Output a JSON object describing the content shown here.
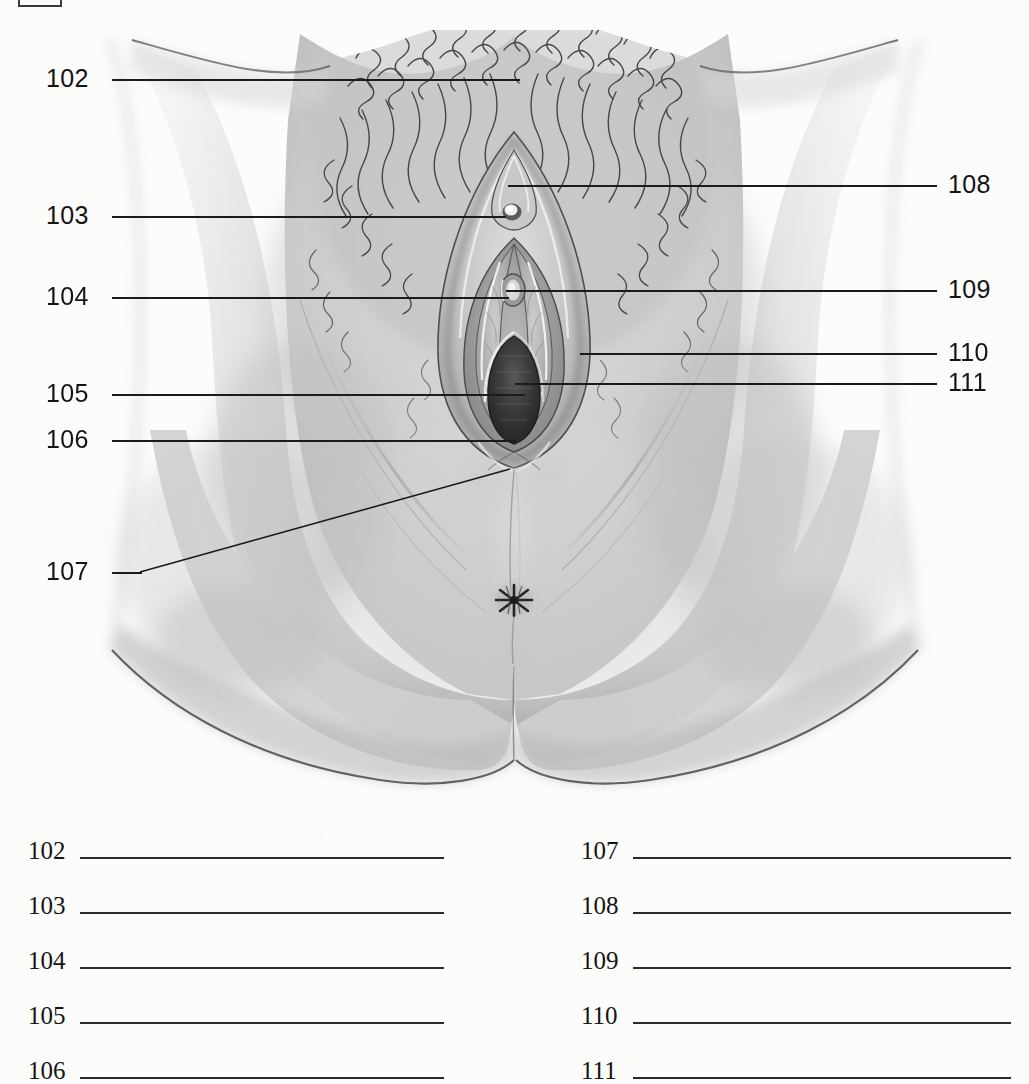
{
  "document": {
    "type": "anatomy-labeling-worksheet",
    "title": "",
    "background_color": "#fcfcfb",
    "ink_color": "#1b1b1b"
  },
  "illustration": {
    "name": "external-female-genitalia-diagram",
    "style": "grayscale pencil/airbrush medical illustration",
    "description": "Anterior view of the external female genitalia (vulva) with surrounding thighs, pubic hair, and perineum"
  },
  "leaders": [
    {
      "id": "102",
      "number": "102",
      "side": "left",
      "label_x": 46,
      "label_y": 66,
      "line_x": 112,
      "line_y": 79,
      "line_w": 408,
      "slanted": false
    },
    {
      "id": "103",
      "number": "103",
      "side": "left",
      "label_x": 46,
      "label_y": 203,
      "line_x": 112,
      "line_y": 216,
      "line_w": 394,
      "slanted": false
    },
    {
      "id": "104",
      "number": "104",
      "side": "left",
      "label_x": 46,
      "label_y": 284,
      "line_x": 112,
      "line_y": 297,
      "line_w": 397,
      "slanted": false
    },
    {
      "id": "105",
      "number": "105",
      "side": "left",
      "label_x": 46,
      "label_y": 381,
      "line_x": 112,
      "line_y": 394,
      "line_w": 413,
      "slanted": false
    },
    {
      "id": "106",
      "number": "106",
      "side": "left",
      "label_x": 46,
      "label_y": 427,
      "line_x": 112,
      "line_y": 440,
      "line_w": 404,
      "slanted": false
    },
    {
      "id": "107",
      "number": "107",
      "side": "left",
      "label_x": 46,
      "label_y": 559,
      "line_x": 112,
      "line_y": 572,
      "line_w": 28,
      "slanted": true,
      "slant": {
        "x1": 140,
        "y1": 572,
        "x2": 508,
        "y2": 469
      }
    },
    {
      "id": "108",
      "number": "108",
      "side": "right",
      "label_x": 950,
      "label_y": 172,
      "line_x": 508,
      "line_y": 185,
      "line_w": 429,
      "slanted": false
    },
    {
      "id": "109",
      "number": "109",
      "side": "right",
      "label_x": 950,
      "label_y": 277,
      "line_x": 506,
      "line_y": 290,
      "line_w": 431,
      "slanted": false
    },
    {
      "id": "110",
      "number": "110",
      "side": "right",
      "label_x": 950,
      "label_y": 340,
      "line_x": 580,
      "line_y": 353,
      "line_w": 357,
      "slanted": false
    },
    {
      "id": "111",
      "number": "111",
      "side": "right",
      "label_x": 950,
      "label_y": 370,
      "line_x": 515,
      "line_y": 383,
      "line_w": 422,
      "slanted": false
    }
  ],
  "answer_blanks": {
    "left_column": [
      {
        "number": "102",
        "value": ""
      },
      {
        "number": "103",
        "value": ""
      },
      {
        "number": "104",
        "value": ""
      },
      {
        "number": "105",
        "value": ""
      },
      {
        "number": "106",
        "value": ""
      }
    ],
    "right_column": [
      {
        "number": "107",
        "value": ""
      },
      {
        "number": "108",
        "value": ""
      },
      {
        "number": "109",
        "value": ""
      },
      {
        "number": "110",
        "value": ""
      },
      {
        "number": "111",
        "value": ""
      }
    ]
  }
}
